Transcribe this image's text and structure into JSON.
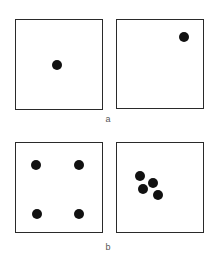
{
  "figure": {
    "rows": [
      {
        "label": "a",
        "label_pos": {
          "x": 108,
          "y": 114
        },
        "panels": [
          {
            "name": "panel-a-left",
            "box": {
              "x": 15,
              "y": 19,
              "w": 88,
              "h": 91
            },
            "dots": [
              {
                "x": 57,
                "y": 65
              }
            ]
          },
          {
            "name": "panel-a-right",
            "box": {
              "x": 116,
              "y": 19,
              "w": 88,
              "h": 90
            },
            "dots": [
              {
                "x": 184,
                "y": 37
              }
            ]
          }
        ]
      },
      {
        "label": "b",
        "label_pos": {
          "x": 108,
          "y": 242
        },
        "panels": [
          {
            "name": "panel-b-left",
            "box": {
              "x": 15,
              "y": 142,
              "w": 88,
              "h": 91
            },
            "dots": [
              {
                "x": 36,
                "y": 165
              },
              {
                "x": 79,
                "y": 165
              },
              {
                "x": 37,
                "y": 214
              },
              {
                "x": 79,
                "y": 214
              }
            ]
          },
          {
            "name": "panel-b-right",
            "box": {
              "x": 116,
              "y": 142,
              "w": 88,
              "h": 91
            },
            "dots": [
              {
                "x": 140,
                "y": 176
              },
              {
                "x": 153,
                "y": 183
              },
              {
                "x": 143,
                "y": 189
              },
              {
                "x": 158,
                "y": 195
              }
            ]
          }
        ]
      }
    ],
    "colors": {
      "border": "#2a2a2a",
      "dot": "#111111",
      "label": "#555555",
      "background": "#ffffff"
    }
  }
}
